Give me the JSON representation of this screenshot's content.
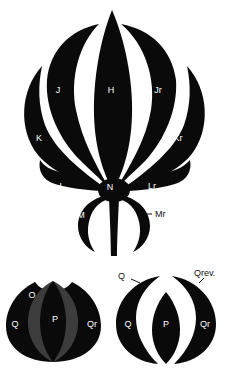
{
  "colors": {
    "shape": "#0a0a0a",
    "gray_region": "#3c3c3c",
    "background": "#ffffff",
    "label_light": "#ffffff",
    "label_dark": "#111111"
  },
  "flower": {
    "labels": {
      "H": "H",
      "J": "J",
      "Jr": "Jr",
      "K": "K",
      "Kr": "Kr",
      "L": "L",
      "N": "N",
      "Lr": "Lr",
      "M": "M",
      "Mr": "Mr"
    }
  },
  "sphere_left": {
    "labels": {
      "O": "O",
      "Q": "Q",
      "P": "P",
      "Qr": "Qr"
    }
  },
  "sphere_right": {
    "labels": {
      "Q_callout": "Q",
      "Qrev": "Qrev.",
      "Q": "Q",
      "P": "P",
      "Qr": "Qr"
    }
  }
}
